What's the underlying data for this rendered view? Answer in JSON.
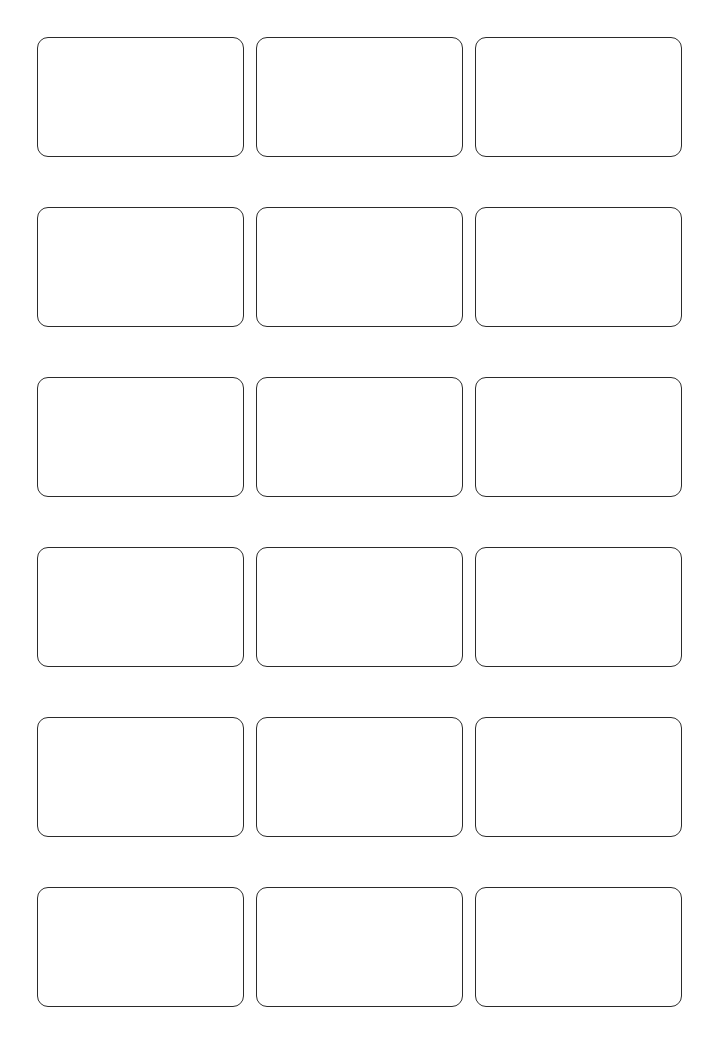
{
  "page": {
    "background_color": "#ffffff",
    "width": 719,
    "height": 1055
  },
  "grid": {
    "columns": 3,
    "rows": 6,
    "card_count": 18,
    "card_width": 207,
    "card_height": 120,
    "column_gap": 12,
    "row_gap": 50,
    "margin_left": 37,
    "margin_top": 37,
    "card_border_color": "#2b2b2b",
    "card_border_width": 1.5,
    "card_corner_radius": 11,
    "card_fill_color": "#ffffff",
    "cards": [
      {
        "id": "card-r1-c1",
        "row": 1,
        "column": 1,
        "content": ""
      },
      {
        "id": "card-r1-c2",
        "row": 1,
        "column": 2,
        "content": ""
      },
      {
        "id": "card-r1-c3",
        "row": 1,
        "column": 3,
        "content": ""
      },
      {
        "id": "card-r2-c1",
        "row": 2,
        "column": 1,
        "content": ""
      },
      {
        "id": "card-r2-c2",
        "row": 2,
        "column": 2,
        "content": ""
      },
      {
        "id": "card-r2-c3",
        "row": 2,
        "column": 3,
        "content": ""
      },
      {
        "id": "card-r3-c1",
        "row": 3,
        "column": 1,
        "content": ""
      },
      {
        "id": "card-r3-c2",
        "row": 3,
        "column": 2,
        "content": ""
      },
      {
        "id": "card-r3-c3",
        "row": 3,
        "column": 3,
        "content": ""
      },
      {
        "id": "card-r4-c1",
        "row": 4,
        "column": 1,
        "content": ""
      },
      {
        "id": "card-r4-c2",
        "row": 4,
        "column": 2,
        "content": ""
      },
      {
        "id": "card-r4-c3",
        "row": 4,
        "column": 3,
        "content": ""
      },
      {
        "id": "card-r5-c1",
        "row": 5,
        "column": 1,
        "content": ""
      },
      {
        "id": "card-r5-c2",
        "row": 5,
        "column": 2,
        "content": ""
      },
      {
        "id": "card-r5-c3",
        "row": 5,
        "column": 3,
        "content": ""
      },
      {
        "id": "card-r6-c1",
        "row": 6,
        "column": 1,
        "content": ""
      },
      {
        "id": "card-r6-c2",
        "row": 6,
        "column": 2,
        "content": ""
      },
      {
        "id": "card-r6-c3",
        "row": 6,
        "column": 3,
        "content": ""
      }
    ]
  }
}
